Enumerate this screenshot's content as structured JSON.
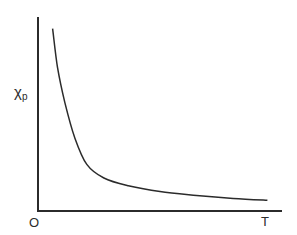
{
  "chart_data": {
    "type": "line",
    "title": "",
    "xlabel": "T",
    "ylabel": "χp",
    "ylabel_main": "χ",
    "ylabel_sub": "p",
    "origin_label": "O",
    "x_end_label": "T",
    "grid": false,
    "legend": null,
    "xlim": [
      0,
      1
    ],
    "ylim": [
      0,
      1
    ],
    "series": [
      {
        "name": "χp vs T",
        "x": [
          0.06,
          0.08,
          0.11,
          0.15,
          0.2,
          0.27,
          0.37,
          0.5,
          0.65,
          0.8,
          0.94
        ],
        "y": [
          0.94,
          0.74,
          0.56,
          0.38,
          0.24,
          0.17,
          0.13,
          0.1,
          0.08,
          0.065,
          0.055
        ]
      }
    ]
  },
  "plot_area": {
    "x0": 38,
    "y0": 211,
    "x1": 282,
    "y1": 17
  },
  "colors": {
    "ink": "#2b2b2b",
    "background": "#ffffff"
  }
}
